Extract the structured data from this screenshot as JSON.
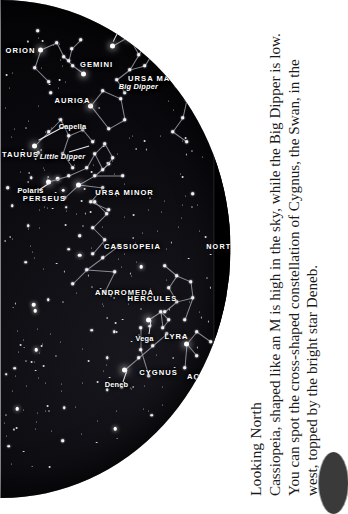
{
  "caption": {
    "heading": "Looking North",
    "body": "Cassiopeia, shaped like an M is high in the sky, while the Big Dipper is low. You can spot the cross-shaped constellation of Cygnus, the Swan, in the west, topped by the bright star Deneb."
  },
  "chart": {
    "view": "Looking North",
    "compass": [
      {
        "label": "WEST"
      },
      {
        "label": "NORTH"
      },
      {
        "label": "EAST"
      }
    ],
    "constellations": [
      {
        "label": "ANDROMEDA"
      },
      {
        "label": "CASSIOPEIA"
      },
      {
        "label": "PERSEUS"
      },
      {
        "label": "TAURUS"
      },
      {
        "label": "AURIGA"
      },
      {
        "label": "ORION"
      },
      {
        "label": "GEMINI"
      },
      {
        "label": "URSA MAJOR"
      },
      {
        "label": "URSA MINOR"
      },
      {
        "label": "HERCULES"
      },
      {
        "label": "CYGNUS"
      },
      {
        "label": "LYRA"
      },
      {
        "label": "AQUILA"
      }
    ],
    "stars": [
      {
        "label": "Capella"
      },
      {
        "label": "Polaris"
      },
      {
        "label": "Castor"
      },
      {
        "label": "Pollux"
      },
      {
        "label": "Deneb"
      },
      {
        "label": "Vega"
      },
      {
        "label": "Mizar & Alcor"
      }
    ],
    "asterisms": [
      {
        "label": "Little Dipper"
      },
      {
        "label": "Big Dipper"
      }
    ],
    "colors": {
      "sky": "#0b0b10",
      "star": "#ffffff",
      "line": "#9fa0ad",
      "label": "#ffffff",
      "caption_text": "#1a1a1a",
      "page": "#ffffff"
    }
  }
}
